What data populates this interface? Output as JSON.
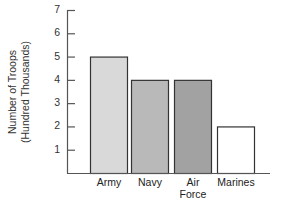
{
  "chart_data": {
    "type": "bar",
    "title": "",
    "xlabel": "",
    "ylabel": "Number of Troops (Hundred Thousands)",
    "ylabel_lines": [
      "Number of Troops",
      "(Hundred Thousands)"
    ],
    "categories": [
      "Army",
      "Navy",
      "Air Force",
      "Marines"
    ],
    "category_label_lines": [
      [
        "Army"
      ],
      [
        "Navy"
      ],
      [
        "Air",
        "Force"
      ],
      [
        "Marines"
      ]
    ],
    "values": [
      5,
      4,
      4,
      2
    ],
    "bar_colors": [
      "#d9d9d9",
      "#b9b9b9",
      "#a2a2a2",
      "#ffffff"
    ],
    "ylim": [
      0,
      7
    ],
    "yticks": [
      1,
      2,
      3,
      4,
      5,
      6,
      7
    ],
    "grid": false,
    "legend": null
  }
}
